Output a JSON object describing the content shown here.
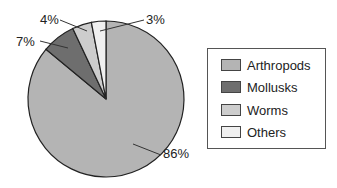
{
  "chart_data": {
    "type": "pie",
    "title": "",
    "categories": [
      "Arthropods",
      "Mollusks",
      "Worms",
      "Others"
    ],
    "values": [
      86,
      7,
      4,
      3
    ],
    "labels": [
      "86%",
      "7%",
      "4%",
      "3%"
    ],
    "colors": [
      "#b4b4b4",
      "#6e6e6e",
      "#cdcdcd",
      "#f0f0f0"
    ],
    "legend_position": "right",
    "start_angle_deg": 0,
    "direction": "clockwise"
  },
  "legend": {
    "items": [
      {
        "label": "Arthropods",
        "color": "#b4b4b4"
      },
      {
        "label": "Mollusks",
        "color": "#6e6e6e"
      },
      {
        "label": "Worms",
        "color": "#cdcdcd"
      },
      {
        "label": "Others",
        "color": "#f0f0f0"
      }
    ]
  }
}
